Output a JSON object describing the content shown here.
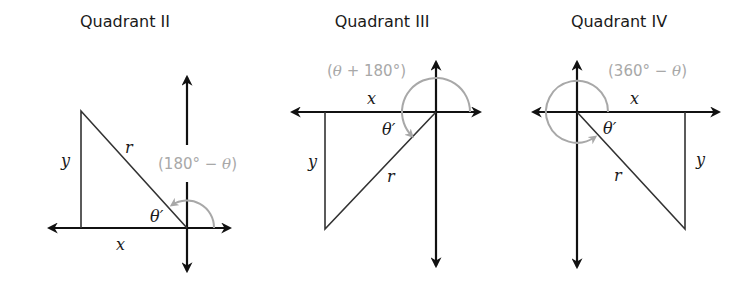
{
  "panels": [
    {
      "title": "Quadrant II",
      "labels": {
        "x": "x",
        "y": "y",
        "r": "r",
        "theta_ref": "θ′"
      },
      "angle_expr": {
        "open": "(180° − ",
        "var": "θ",
        "close": ")"
      }
    },
    {
      "title": "Quadrant III",
      "labels": {
        "x": "x",
        "y": "y",
        "r": "r",
        "theta_ref": "θ′"
      },
      "angle_expr": {
        "open": "(",
        "var": "θ",
        "close": " + 180°)"
      }
    },
    {
      "title": "Quadrant IV",
      "labels": {
        "x": "x",
        "y": "y",
        "r": "r",
        "theta_ref": "θ′"
      },
      "angle_expr": {
        "open": "(360° − ",
        "var": "θ",
        "close": ")"
      }
    }
  ],
  "colors": {
    "axis": "#111111",
    "triangle": "#333333",
    "angle_arc": "#a8a8a8",
    "text": "#1a1a1a"
  }
}
